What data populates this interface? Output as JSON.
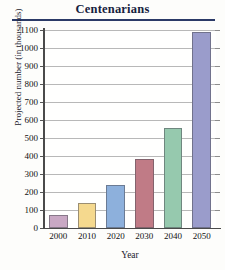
{
  "chart_data": {
    "type": "bar",
    "title": "Centenarians",
    "xlabel": "Year",
    "ylabel": "Projected number (in thousands)",
    "categories": [
      "2000",
      "2010",
      "2020",
      "2030",
      "2040",
      "2050"
    ],
    "values": [
      75,
      140,
      240,
      385,
      555,
      1090
    ],
    "ylim": [
      0,
      1100
    ],
    "ytick_labels": [
      "0",
      "100",
      "200",
      "300",
      "400",
      "500",
      "600",
      "700",
      "800",
      "900",
      "1000",
      "1100"
    ],
    "ytick_values": [
      0,
      100,
      200,
      300,
      400,
      500,
      600,
      700,
      800,
      900,
      1000,
      1100
    ],
    "grid": true,
    "legend": false,
    "bar_colors": [
      "#c9a8c4",
      "#f5d98e",
      "#8db0dc",
      "#c07b86",
      "#96c9ae",
      "#9a9ccb"
    ],
    "title_rule_color": "#2b3a67"
  }
}
